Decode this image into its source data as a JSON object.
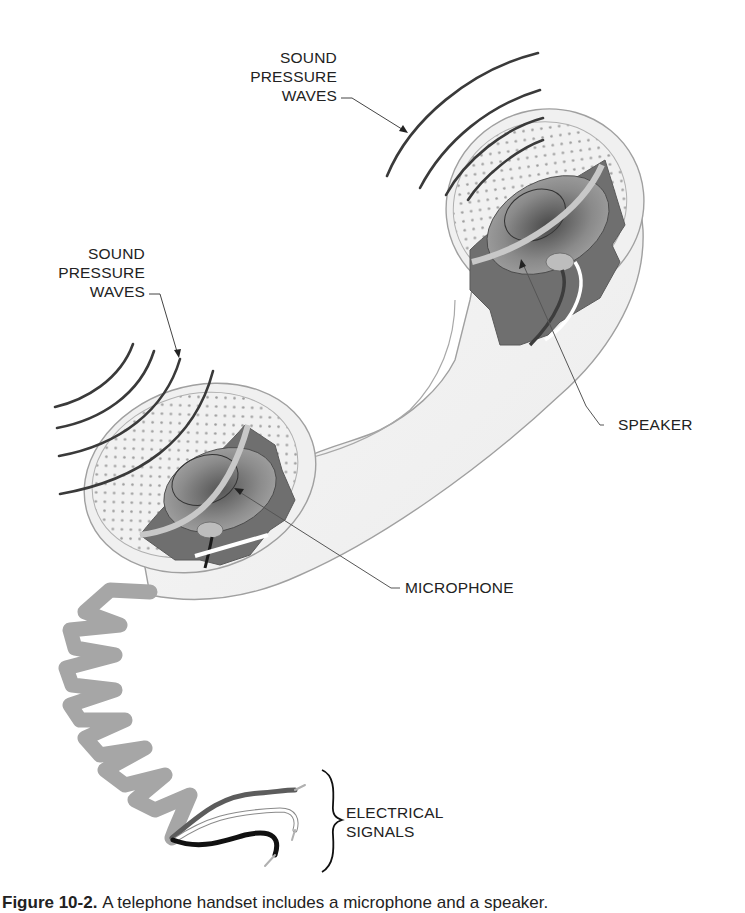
{
  "diagram": {
    "labels": {
      "top_waves": [
        "SOUND",
        "PRESSURE",
        "WAVES"
      ],
      "left_waves": [
        "SOUND",
        "PRESSURE",
        "WAVES"
      ],
      "speaker": "SPEAKER",
      "microphone": "MICROPHONE",
      "electrical": [
        "ELECTRICAL",
        "SIGNALS"
      ]
    },
    "components": [
      {
        "id": "speaker",
        "label": "SPEAKER",
        "location": "upper-right earpiece"
      },
      {
        "id": "microphone",
        "label": "MICROPHONE",
        "location": "lower-left mouthpiece"
      },
      {
        "id": "coiled-cord",
        "label": "",
        "location": "below mouthpiece"
      },
      {
        "id": "wires",
        "label": "ELECTRICAL SIGNALS",
        "count": 3
      }
    ],
    "colors": {
      "outline": "#9a9a9a",
      "body_fill": "#f4f4f4",
      "cutaway_dark": "#6f6f6f",
      "cone": "#8a8a8a",
      "cord": "#a8a8a8",
      "waves": "#3a3a3a",
      "text": "#222222"
    }
  },
  "caption": {
    "figure_number": "Figure 10-2.",
    "text": "A telephone handset includes a microphone and a speaker."
  }
}
